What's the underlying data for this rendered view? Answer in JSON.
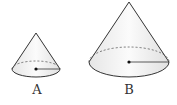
{
  "diagram": {
    "stroke_color": "#333333",
    "fill_color": "#f2f2f2",
    "cones": [
      {
        "label": "A",
        "apex": [
          36,
          33
        ],
        "center": [
          36,
          69
        ],
        "rx": 24,
        "ry": 8,
        "label_pos": [
          37,
          83
        ]
      },
      {
        "label": "B",
        "apex": [
          129,
          2
        ],
        "center": [
          129,
          62
        ],
        "rx": 40,
        "ry": 15,
        "label_pos": [
          129,
          83
        ]
      }
    ]
  }
}
